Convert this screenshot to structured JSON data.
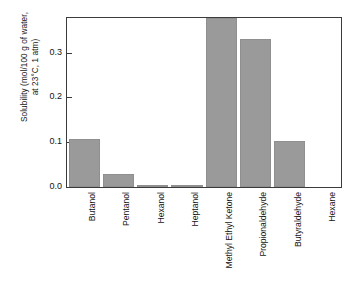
{
  "chart_data": {
    "type": "bar",
    "title": "",
    "xlabel": "",
    "ylabel_line1": "Solubility (mol/100 g of water,",
    "ylabel_line2": "at 23°C, 1 atm)",
    "ylabel": "Solubility (mol/100 g of water, at 23°C, 1 atm)",
    "categories": [
      "Butanol",
      "Pentanol",
      "Hexanol",
      "Heptanol",
      "Methyl Ethyl Ketone",
      "Propionaldehyde",
      "Butyraldehyde",
      "Hexane"
    ],
    "values": [
      0.108,
      0.029,
      0.005,
      0.001,
      0.377,
      0.331,
      0.102,
      0.0
    ],
    "ylim": [
      0.0,
      0.377
    ],
    "yticks": [
      0.0,
      0.1,
      0.2,
      0.3
    ],
    "ytick_labels": [
      "0.0",
      "0.1",
      "0.2",
      "0.3"
    ],
    "grid": false,
    "legend": false,
    "bar_color": "#9a9a9a",
    "axis_color": "#3b3b3b",
    "background": "#ffffff"
  }
}
